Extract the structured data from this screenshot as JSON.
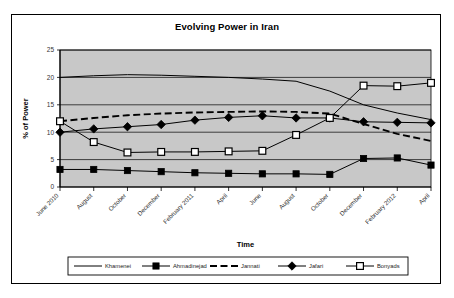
{
  "chart_data": {
    "type": "line",
    "title": "Evolving Power in Iran",
    "xlabel": "Time",
    "ylabel": "% of Power",
    "ylim": [
      0,
      25
    ],
    "yticks": [
      0,
      5,
      10,
      15,
      20,
      25
    ],
    "grid": true,
    "legend_position": "bottom",
    "plot_background": "#c8c8c8",
    "categories": [
      "June 2010",
      "August",
      "October",
      "December",
      "February 2011",
      "April",
      "June",
      "August",
      "October",
      "December",
      "February 2012",
      "April"
    ],
    "series": [
      {
        "name": "Khamenei",
        "marker": "none",
        "dash": "solid",
        "color": "#000000",
        "values": [
          20.0,
          20.3,
          20.5,
          20.4,
          20.2,
          20.0,
          19.7,
          19.3,
          17.5,
          15.0,
          13.5,
          12.3
        ]
      },
      {
        "name": "Ahmadinejad",
        "marker": "filled-square",
        "dash": "solid",
        "color": "#000000",
        "values": [
          3.2,
          3.2,
          3.0,
          2.8,
          2.6,
          2.5,
          2.4,
          2.4,
          2.3,
          5.2,
          5.3,
          4.0
        ]
      },
      {
        "name": "Jannati",
        "marker": "none",
        "dash": "dashed",
        "color": "#000000",
        "values": [
          12.0,
          12.6,
          13.1,
          13.4,
          13.6,
          13.7,
          13.8,
          13.7,
          13.4,
          11.5,
          9.7,
          8.4
        ]
      },
      {
        "name": "Jafari",
        "marker": "filled-diamond",
        "dash": "solid",
        "color": "#000000",
        "values": [
          10.0,
          10.6,
          11.0,
          11.4,
          12.2,
          12.7,
          13.0,
          12.6,
          12.6,
          11.9,
          11.8,
          11.7
        ]
      },
      {
        "name": "Bonyads",
        "marker": "open-square",
        "dash": "solid",
        "color": "#000000",
        "values": [
          12.0,
          8.2,
          6.3,
          6.4,
          6.4,
          6.5,
          6.6,
          9.5,
          12.6,
          18.5,
          18.4,
          19.0
        ]
      }
    ]
  }
}
